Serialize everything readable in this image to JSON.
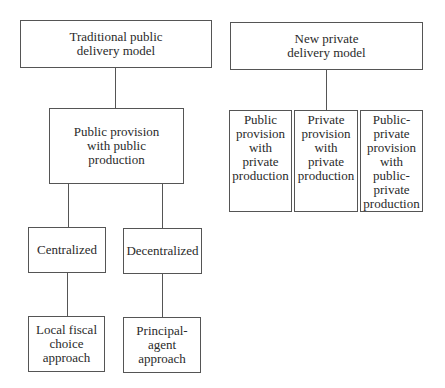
{
  "diagram": {
    "traditional": {
      "label": "Traditional public\ndelivery model",
      "child": {
        "label": "Public provision\nwith public\nproduction",
        "branches": [
          {
            "label": "Centralized",
            "child": {
              "label": "Local fiscal\nchoice\napproach"
            }
          },
          {
            "label": "Decentralized",
            "child": {
              "label": "Principal-\nagent\napproach"
            }
          }
        ]
      }
    },
    "private": {
      "label": "New private\ndelivery model",
      "children": [
        {
          "label": "Public\nprovision\nwith\nprivate\nproduction"
        },
        {
          "label": "Private\nprovision\nwith\nprivate\nproduction"
        },
        {
          "label": "Public-\nprivate\nprovision\nwith\npublic-\nprivate\nproduction"
        }
      ]
    }
  }
}
